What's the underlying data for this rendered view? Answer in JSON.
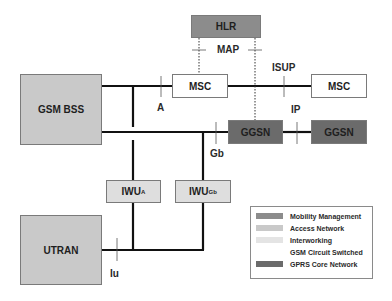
{
  "nodes": {
    "hlr": {
      "label": "HLR",
      "category": "Mobility Management"
    },
    "msc_local": {
      "label": "MSC",
      "category": "GSM Circuit Switched"
    },
    "msc_remote": {
      "label": "MSC",
      "category": "GSM Circuit Switched"
    },
    "gsm_bss": {
      "label": "GSM BSS",
      "category": "Access Network"
    },
    "ggsn_local": {
      "label": "GGSN",
      "category": "GPRS Core Network"
    },
    "ggsn_remote": {
      "label": "GGSN",
      "category": "GPRS Core Network"
    },
    "iwu_a": {
      "label": "IWU",
      "subscript": "A",
      "category": "Interworking"
    },
    "iwu_gb": {
      "label": "IWU",
      "subscript": "Gb",
      "category": "Interworking"
    },
    "utran": {
      "label": "UTRAN",
      "category": "Access Network"
    }
  },
  "interfaces": {
    "map": "MAP",
    "isup": "ISUP",
    "a": "A",
    "ip": "IP",
    "gb": "Gb",
    "iu": "Iu"
  },
  "edges": [
    {
      "from": "gsm_bss",
      "to": "msc_local",
      "interface": "A",
      "style": "solid"
    },
    {
      "from": "msc_local",
      "to": "msc_remote",
      "interface": "ISUP",
      "style": "solid"
    },
    {
      "from": "gsm_bss",
      "to": "ggsn_local",
      "interface": "Gb",
      "style": "solid"
    },
    {
      "from": "ggsn_local",
      "to": "ggsn_remote",
      "interface": "IP",
      "style": "solid"
    },
    {
      "from": "hlr",
      "to": "msc_local",
      "interface": "MAP",
      "style": "dotted"
    },
    {
      "from": "hlr",
      "to": "ggsn_local",
      "interface": "MAP",
      "style": "dotted"
    },
    {
      "from": "utran",
      "to": "iwu_a",
      "interface": "Iu",
      "style": "solid"
    },
    {
      "from": "utran",
      "to": "iwu_gb",
      "interface": "Iu",
      "style": "solid"
    },
    {
      "from": "iwu_a",
      "to": "msc_local",
      "interface": "A",
      "style": "solid"
    },
    {
      "from": "iwu_gb",
      "to": "ggsn_local",
      "interface": "Gb",
      "style": "solid"
    }
  ],
  "legend": {
    "items": [
      {
        "label": "Mobility Management",
        "color": "#8c8c8c"
      },
      {
        "label": "Access Network",
        "color": "#c9c9c9"
      },
      {
        "label": "Interworking",
        "color": "#e4e4e4"
      },
      {
        "label": "GSM Circuit Switched",
        "color": "#ffffff"
      },
      {
        "label": "GPRS Core Network",
        "color": "#6b6b6b"
      }
    ]
  }
}
